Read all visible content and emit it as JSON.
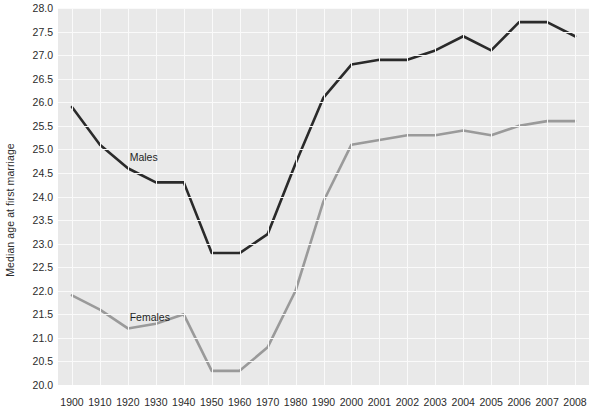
{
  "chart_data": {
    "type": "line",
    "title": "",
    "xlabel": "",
    "ylabel": "Median age at first marriage",
    "ylim": [
      20.0,
      28.0
    ],
    "ytick_step": 0.5,
    "grid": true,
    "legend_position": "inline-annotations",
    "categories": [
      "1900",
      "1910",
      "1920",
      "1930",
      "1940",
      "1950",
      "1960",
      "1970",
      "1980",
      "1990",
      "2000",
      "2001",
      "2002",
      "2003",
      "2004",
      "2005",
      "2006",
      "2007",
      "2008"
    ],
    "ytick_labels": [
      "28.0",
      "27.5",
      "27.0",
      "26.5",
      "26.0",
      "25.5",
      "25.0",
      "24.5",
      "24.0",
      "23.5",
      "23.0",
      "22.5",
      "22.0",
      "21.5",
      "21.0",
      "20.5",
      "20.0"
    ],
    "series": [
      {
        "name": "Males",
        "color": "#2a2a2a",
        "values": [
          25.9,
          25.1,
          24.6,
          24.3,
          24.3,
          22.8,
          22.8,
          23.2,
          24.7,
          26.1,
          26.8,
          26.9,
          26.9,
          27.1,
          27.4,
          27.1,
          27.7,
          27.7,
          27.4
        ]
      },
      {
        "name": "Females",
        "color": "#9a9a9a",
        "values": [
          21.9,
          21.6,
          21.2,
          21.3,
          21.5,
          20.3,
          20.3,
          20.8,
          22.0,
          23.9,
          25.1,
          25.2,
          25.3,
          25.3,
          25.4,
          25.3,
          25.5,
          25.6,
          25.6
        ]
      }
    ],
    "annotations": [
      {
        "name": "Males",
        "label": "Males",
        "x_pct": 13.5,
        "y_pct": 38.0
      },
      {
        "name": "Females",
        "label": "Females",
        "x_pct": 13.5,
        "y_pct": 80.5
      }
    ],
    "colors": {
      "plot_background": "#e9e9e9",
      "gridline": "#fafafa",
      "males_line": "#2a2a2a",
      "females_line": "#9a9a9a",
      "text": "#2b2b2b",
      "page_background": "#ffffff"
    }
  }
}
